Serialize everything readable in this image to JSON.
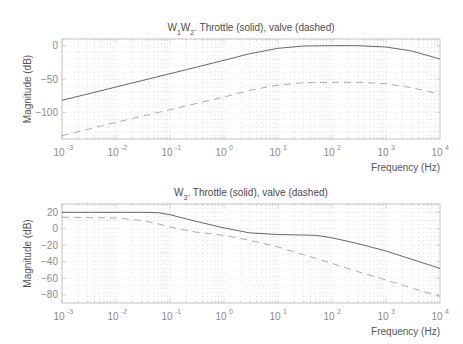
{
  "chart_data": [
    {
      "type": "line",
      "title": "W1W2. Throttle (solid), valve (dashed)",
      "title_parts": [
        {
          "text": "W",
          "sub": false
        },
        {
          "text": "1",
          "sub": true
        },
        {
          "text": "W",
          "sub": false
        },
        {
          "text": "2",
          "sub": true
        },
        {
          "text": ". Throttle (solid), valve (dashed)",
          "sub": false
        }
      ],
      "xlabel": "Frequency  (Hz)",
      "ylabel": "Magnitude (dB)",
      "xscale": "log",
      "xlim": [
        0.001,
        10000
      ],
      "ylim": [
        -140,
        10
      ],
      "xticks": [
        -3,
        -2,
        -1,
        0,
        1,
        2,
        3,
        4
      ],
      "xtick_labels": [
        "10^-3",
        "10^-2",
        "10^-1",
        "10^0",
        "10^1",
        "10^2",
        "10^3",
        "10^4"
      ],
      "yticks": [
        0,
        -50,
        -100
      ],
      "ytick_labels": [
        "0",
        "-50",
        "-100"
      ],
      "grid": true,
      "x": [
        0.001,
        0.01,
        0.1,
        1,
        3,
        10,
        30,
        100,
        300,
        1000,
        3000,
        10000
      ],
      "series": [
        {
          "name": "Throttle",
          "style": "solid",
          "values": [
            -82,
            -62,
            -42,
            -22,
            -12,
            -4,
            -0.5,
            0,
            0,
            -2,
            -8,
            -20
          ]
        },
        {
          "name": "Valve",
          "style": "dashed",
          "values": [
            -135,
            -115,
            -96,
            -77,
            -67,
            -59,
            -55.5,
            -55,
            -55,
            -57,
            -63,
            -73
          ]
        }
      ]
    },
    {
      "type": "line",
      "title": "W3. Throttle (solid), valve (dashed)",
      "title_parts": [
        {
          "text": "W",
          "sub": false
        },
        {
          "text": "3",
          "sub": true
        },
        {
          "text": ". Throttle (solid), valve (dashed)",
          "sub": false
        }
      ],
      "xlabel": "Frequency  (Hz)",
      "ylabel": "Magnitude (dB)",
      "xscale": "log",
      "xlim": [
        0.001,
        10000
      ],
      "ylim": [
        -90,
        30
      ],
      "xticks": [
        -3,
        -2,
        -1,
        0,
        1,
        2,
        3,
        4
      ],
      "xtick_labels": [
        "10^-3",
        "10^-2",
        "10^-1",
        "10^0",
        "10^1",
        "10^2",
        "10^3",
        "10^4"
      ],
      "yticks": [
        20,
        0,
        -20,
        -40,
        -60,
        -80
      ],
      "ytick_labels": [
        "20",
        "0",
        "-20",
        "-40",
        "-60",
        "-80"
      ],
      "grid": true,
      "x": [
        0.001,
        0.01,
        0.03,
        0.06,
        0.1,
        0.3,
        1,
        3,
        10,
        50,
        100,
        300,
        1000,
        3000,
        10000
      ],
      "series": [
        {
          "name": "Throttle",
          "style": "solid",
          "values": [
            20,
            20,
            20,
            19.5,
            17,
            9,
            1,
            -5,
            -7,
            -8,
            -11,
            -18,
            -27,
            -37,
            -48
          ]
        },
        {
          "name": "Valve",
          "style": "dashed",
          "values": [
            14,
            13,
            10,
            6,
            2,
            -4,
            -8,
            -14,
            -22,
            -36,
            -42,
            -52,
            -62,
            -72,
            -82
          ]
        }
      ]
    }
  ],
  "colors": {
    "axis": "#b8b8b8",
    "grid": "#cfcfcf",
    "solid_line": "#555555",
    "dashed_line": "#a0a0a0",
    "tick_text": "#8a8a8a"
  },
  "layout": [
    {
      "left": 62,
      "right": 440,
      "top": 39,
      "bottom": 139,
      "title_y": 31,
      "tick_label_y": 156,
      "xlabel_y": 171
    },
    {
      "left": 62,
      "right": 440,
      "top": 204,
      "bottom": 303,
      "title_y": 196,
      "tick_label_y": 320,
      "xlabel_y": 335
    }
  ]
}
